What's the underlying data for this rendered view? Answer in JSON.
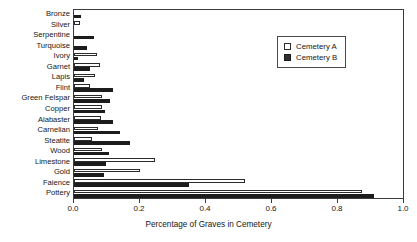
{
  "chart_data": {
    "type": "bar",
    "orientation": "horizontal",
    "title": "",
    "xlabel": "Percentage of Graves in Cemetery",
    "ylabel": "",
    "xlim": [
      0.0,
      1.0
    ],
    "xticks": [
      "0.0",
      "0.2",
      "0.4",
      "0.6",
      "0.8",
      "1.0"
    ],
    "xtick_values": [
      0.0,
      0.2,
      0.4,
      0.6,
      0.8,
      1.0
    ],
    "grid": false,
    "legend_position": "upper right",
    "categories": [
      "Bronze",
      "Silver",
      "Serpentine",
      "Turquoise",
      "Ivory",
      "Garnet",
      "Lapis",
      "Flint",
      "Green Felspar",
      "Copper",
      "Alabaster",
      "Carnelian",
      "Steatite",
      "Wood",
      "Limestone",
      "Gold",
      "Faience",
      "Pottery"
    ],
    "series": [
      {
        "name": "Cemetery A",
        "color": "#ffffff",
        "edge_color": "#2b2b2b",
        "values": [
          0.0,
          0.018,
          0.0,
          0.0,
          0.07,
          0.08,
          0.065,
          0.048,
          0.085,
          0.085,
          0.082,
          0.073,
          0.055,
          0.085,
          0.245,
          0.2,
          0.52,
          0.875
        ]
      },
      {
        "name": "Cemetery B",
        "color": "#1c1c1c",
        "edge_color": "#1c1c1c",
        "values": [
          0.022,
          0.0,
          0.062,
          0.04,
          0.012,
          0.048,
          0.03,
          0.12,
          0.11,
          0.095,
          0.118,
          0.14,
          0.17,
          0.105,
          0.098,
          0.092,
          0.35,
          0.912
        ]
      }
    ]
  },
  "legend": {
    "items": [
      {
        "label": "Cemetery A",
        "swatch": "open-square"
      },
      {
        "label": "Cemetery B",
        "swatch": "filled-square"
      }
    ]
  },
  "colors": {
    "series_a": "#ffffff",
    "series_b": "#1c1c1c",
    "axis": "#3b3b3b",
    "text": "#161616",
    "background": "#ffffff"
  }
}
